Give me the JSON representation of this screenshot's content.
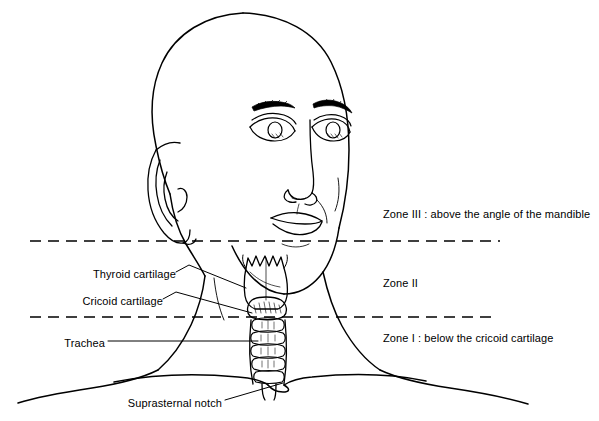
{
  "figure": {
    "type": "anatomical-line-diagram",
    "background_color": "#ffffff",
    "stroke_color": "#000000",
    "view": "bald head, three-quarter anterior view, larynx and trachea overlaid on the neck"
  },
  "zones": [
    {
      "id": "zone-3",
      "label": "Zone III :  above the angle of the mandible",
      "x": 383,
      "y": 214
    },
    {
      "id": "zone-2",
      "label": "Zone II",
      "x": 383,
      "y": 283
    },
    {
      "id": "zone-1",
      "label": "Zone I :  below the cricoid cartilage",
      "x": 383,
      "y": 338
    }
  ],
  "zone_boundaries": [
    {
      "id": "upper-dashed-line",
      "y": 241,
      "x_start": 30,
      "x_end": 500
    },
    {
      "id": "lower-dashed-line",
      "y": 317,
      "x_start": 30,
      "x_end": 497
    }
  ],
  "anatomy_labels": [
    {
      "id": "thyroid-cartilage",
      "label": "Thyroid cartilage",
      "text_x": 82,
      "text_y": 274,
      "leader": "from 176,272 to 246,288"
    },
    {
      "id": "cricoid-cartilage",
      "label": "Cricoid cartilage",
      "text_x": 73,
      "text_y": 301,
      "leader": "from 163,299 to 252,313"
    },
    {
      "id": "trachea",
      "label": "Trachea",
      "text_x": 56,
      "text_y": 344,
      "leader": "from 108,341 to 258,341"
    },
    {
      "id": "suprasternal-notch",
      "label": "Suprasternal notch",
      "text_x": 127,
      "text_y": 404,
      "leader": "from 225,400 to 283,383"
    }
  ]
}
